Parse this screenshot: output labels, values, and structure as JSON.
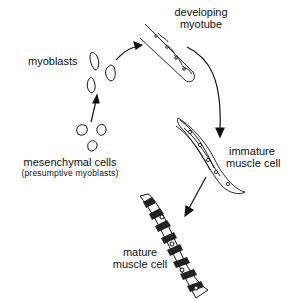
{
  "diagram": {
    "labels": {
      "myoblasts": "myoblasts",
      "developing_line1": "developing",
      "developing_line2": "myotube",
      "immature_line1": "immature",
      "immature_line2": "muscle cell",
      "mature_line1": "mature",
      "mature_line2": "muscle cell",
      "mesenchymal_line1": "mesenchymal cells",
      "mesenchymal_line2": "(presumptive myoblasts)"
    },
    "stages": [
      "mesenchymal cells (presumptive myoblasts)",
      "myoblasts",
      "developing myotube",
      "immature muscle cell",
      "mature muscle cell"
    ],
    "colors": {
      "ink": "#111111",
      "background": "#ffffff"
    }
  }
}
